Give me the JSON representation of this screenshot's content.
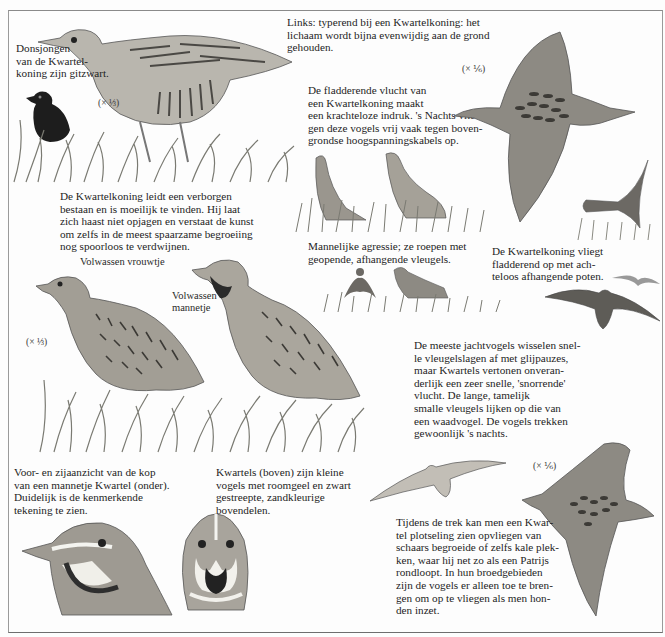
{
  "page": {
    "captions": {
      "chick": "Donsjongen\nvan de Kwartel-\nkoning zijn gitzwart.",
      "posture": "Links: typerend bij een Kwartelkoning: het\nlichaam wordt bijna evenwijdig aan de grond\ngehouden.",
      "flutter_flight": "De fladderende vlucht van\neen Kwartelkoning maakt\neen krachteloze indruk. 's Nachts vlie-\ngen deze vogels vrij vaak tegen boven-\ngrondse hoogspanningskabels op.",
      "hidden_life": "De Kwartelkoning leidt een verborgen\nbestaan en is moeilijk te vinden. Hij laat\nzich haast niet opjagen en verstaat de kunst\nom zelfs in de meest spaarzame begroeiing\nnog spoorloos te verdwijnen.",
      "aggression": "Mannelijke agressie; ze roepen met\ngeopende, afhangende vleugels.",
      "takeoff": "De Kwartelkoning vliegt\nfladderend op met ach-\nteloos afhangende poten.",
      "quail_flight": "De meeste jachtvogels wisselen snel-\nle vleugelslagen af met glijpauzes,\nmaar Kwartels vertonen onveran-\nderlijk een zeer snelle, 'snorrende'\nvlucht. De lange, tamelijk\nsmalle vleugels lijken op die van\neen waadvogel. De vogels trekken\ngewoonlijk 's nachts.",
      "heads": "Voor- en zijaanzicht van de kop\nvan een mannetje Kwartel (onder).\nDuidelijk is de kenmerkende\ntekening te zien.",
      "quail_desc": "Kwartels (boven) zijn kleine\nvogels met roomgeel en zwart\ngestreepte, zandkleurige\nbovendelen.",
      "migration": "Tijdens de trek kan men een Kwar-\ntel plotseling zien opvliegen van\nschaars begroeide of zelfs kale plek-\nken, waar hij net zo als een Patrijs\nrondloopt. In hun broedgebieden\nzijn de vogels er alleen toe te bren-\ngen om op te vliegen als men hon-\nden inzet."
    },
    "labels": {
      "female": "Volwassen vrouwtje",
      "male": "Volwassen\nmannetje"
    },
    "scales": {
      "corncrake_walking": "(× ⅓)",
      "corncrake_flying": "(× ⅙)",
      "quails": "(× ⅓)",
      "quail_flying": "(× ⅙)"
    },
    "colors": {
      "ink": "#1e1e1e",
      "plumage_light": "#b9b6ae",
      "plumage_mid": "#8d8a83",
      "plumage_dark": "#4a4844",
      "grass": "#7a7a72",
      "paper": "#fdfdfd"
    }
  }
}
